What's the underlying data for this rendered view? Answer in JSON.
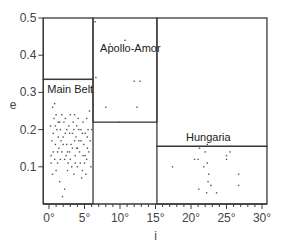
{
  "chart_data": {
    "type": "scatter",
    "title": "",
    "xlabel": "i",
    "ylabel": "e",
    "xlim": [
      -0.8,
      30.7
    ],
    "ylim": [
      0,
      0.5
    ],
    "x_ticks": [
      "0°",
      "5°",
      "10°",
      "15°",
      "20°",
      "25°",
      "30°"
    ],
    "x_tick_values": [
      0,
      5,
      10,
      15,
      20,
      25,
      30
    ],
    "y_ticks": [
      "0.1",
      "0.2",
      "0.3",
      "0.4",
      "0.5"
    ],
    "y_tick_values": [
      0.1,
      0.2,
      0.3,
      0.4,
      0.5
    ],
    "grid": false,
    "regions": [
      {
        "name": "Main Belt",
        "x_range": [
          -0.8,
          6.2
        ],
        "y_range": [
          0,
          0.335
        ]
      },
      {
        "name": "Apollo-Amor",
        "x_range": [
          6.2,
          15.2
        ],
        "y_range": [
          0.22,
          0.5
        ]
      },
      {
        "name": "Hungaria",
        "x_range": [
          15.2,
          30.7
        ],
        "y_range": [
          0,
          0.155
        ]
      }
    ],
    "series": [
      {
        "name": "Main Belt",
        "points": [
          [
            0.2,
            0.21
          ],
          [
            0.5,
            0.08
          ],
          [
            0.3,
            0.13
          ],
          [
            0.8,
            0.27
          ],
          [
            1.0,
            0.24
          ],
          [
            1.3,
            0.22
          ],
          [
            0.6,
            0.19
          ],
          [
            0.9,
            0.16
          ],
          [
            1.6,
            0.2
          ],
          [
            1.2,
            0.11
          ],
          [
            2.0,
            0.18
          ],
          [
            2.3,
            0.23
          ],
          [
            1.8,
            0.14
          ],
          [
            2.5,
            0.16
          ],
          [
            2.8,
            0.21
          ],
          [
            3.0,
            0.12
          ],
          [
            3.3,
            0.19
          ],
          [
            3.6,
            0.24
          ],
          [
            3.9,
            0.15
          ],
          [
            4.2,
            0.2
          ],
          [
            4.5,
            0.17
          ],
          [
            4.8,
            0.22
          ],
          [
            5.1,
            0.13
          ],
          [
            5.4,
            0.18
          ],
          [
            5.7,
            0.25
          ],
          [
            5.9,
            0.1
          ],
          [
            1.5,
            0.06
          ],
          [
            2.2,
            0.04
          ],
          [
            1.9,
            0.02
          ],
          [
            2.6,
            0.09
          ],
          [
            3.5,
            0.08
          ],
          [
            4.0,
            0.1
          ],
          [
            4.6,
            0.07
          ],
          [
            5.2,
            0.08
          ],
          [
            0.4,
            0.17
          ],
          [
            1.1,
            0.2
          ],
          [
            1.7,
            0.17
          ],
          [
            2.4,
            0.13
          ],
          [
            3.1,
            0.16
          ],
          [
            3.7,
            0.13
          ],
          [
            4.3,
            0.14
          ],
          [
            4.9,
            0.16
          ],
          [
            5.5,
            0.2
          ],
          [
            0.7,
            0.23
          ],
          [
            1.4,
            0.15
          ],
          [
            2.1,
            0.22
          ],
          [
            2.9,
            0.19
          ],
          [
            3.4,
            0.22
          ],
          [
            4.1,
            0.23
          ],
          [
            4.7,
            0.19
          ],
          [
            5.3,
            0.23
          ],
          [
            5.8,
            0.17
          ],
          [
            0.3,
            0.11
          ],
          [
            1.0,
            0.09
          ],
          [
            1.6,
            0.12
          ],
          [
            2.7,
            0.11
          ],
          [
            3.2,
            0.1
          ],
          [
            3.8,
            0.18
          ],
          [
            4.4,
            0.11
          ],
          [
            5.0,
            0.11
          ],
          [
            5.6,
            0.14
          ],
          [
            0.6,
            0.14
          ],
          [
            1.3,
            0.18
          ],
          [
            2.0,
            0.16
          ],
          [
            2.5,
            0.2
          ],
          [
            3.0,
            0.24
          ],
          [
            3.6,
            0.17
          ],
          [
            4.2,
            0.17
          ],
          [
            4.8,
            0.13
          ],
          [
            5.4,
            0.15
          ],
          [
            6.0,
            0.2
          ],
          [
            0.9,
            0.21
          ],
          [
            1.8,
            0.24
          ],
          [
            2.3,
            0.19
          ],
          [
            3.3,
            0.15
          ],
          [
            3.9,
            0.21
          ],
          [
            4.5,
            0.2
          ],
          [
            5.1,
            0.19
          ],
          [
            0.5,
            0.26
          ],
          [
            1.2,
            0.14
          ],
          [
            2.6,
            0.14
          ],
          [
            3.5,
            0.2
          ],
          [
            4.0,
            0.15
          ],
          [
            4.7,
            0.09
          ],
          [
            5.3,
            0.12
          ],
          [
            0.8,
            0.12
          ],
          [
            1.5,
            0.22
          ],
          [
            2.2,
            0.12
          ],
          [
            2.9,
            0.14
          ],
          [
            3.7,
            0.11
          ]
        ]
      },
      {
        "name": "Apollo-Amor",
        "points": [
          [
            6.5,
            0.49
          ],
          [
            8.6,
            0.43
          ],
          [
            10.7,
            0.44
          ],
          [
            6.6,
            0.34
          ],
          [
            12.0,
            0.33
          ],
          [
            12.8,
            0.33
          ],
          [
            8.0,
            0.26
          ],
          [
            12.4,
            0.26
          ],
          [
            9.9,
            0.22
          ]
        ]
      },
      {
        "name": "Hungaria",
        "points": [
          [
            17.4,
            0.1
          ],
          [
            20.5,
            0.12
          ],
          [
            21.2,
            0.15
          ],
          [
            22.0,
            0.14
          ],
          [
            21.0,
            0.12
          ],
          [
            21.8,
            0.1
          ],
          [
            22.3,
            0.11
          ],
          [
            22.5,
            0.08
          ],
          [
            22.4,
            0.06
          ],
          [
            22.8,
            0.05
          ],
          [
            21.1,
            0.04
          ],
          [
            22.2,
            0.03
          ],
          [
            23.6,
            0.03
          ],
          [
            25.0,
            0.12
          ],
          [
            25.0,
            0.13
          ],
          [
            25.5,
            0.14
          ],
          [
            26.7,
            0.08
          ],
          [
            26.7,
            0.05
          ],
          [
            22.3,
            0.16
          ]
        ]
      }
    ]
  }
}
